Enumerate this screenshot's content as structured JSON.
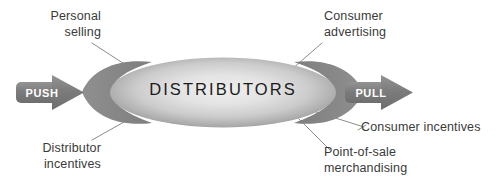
{
  "diagram": {
    "hub": {
      "label": "DISTRIBUTORS",
      "fill_center": "#e6e6e6",
      "fill_edge": "#8f8f8f"
    },
    "wings": {
      "fill": "#8a8a8a"
    },
    "arrows": [
      {
        "id": "push",
        "label": "PUSH",
        "direction": "right",
        "fill": "#7d7d7d",
        "text_color": "#ffffff"
      },
      {
        "id": "pull",
        "label": "PULL",
        "direction": "right",
        "fill": "#7d7d7d",
        "text_color": "#ffffff"
      }
    ],
    "callouts": [
      {
        "id": "personal-selling",
        "line1": "Personal",
        "line2": "selling",
        "align": "right",
        "position": "top-left"
      },
      {
        "id": "consumer-advertising",
        "line1": "Consumer",
        "line2": "advertising",
        "align": "left",
        "position": "top-right"
      },
      {
        "id": "distributor-incentives",
        "line1": "Distributor",
        "line2": "incentives",
        "align": "right",
        "position": "bottom-left"
      },
      {
        "id": "consumer-incentives",
        "line1": "Consumer incentives",
        "line2": "",
        "align": "left",
        "position": "right"
      },
      {
        "id": "point-of-sale-merchandising",
        "line1": "Point-of-sale",
        "line2": "merchandising",
        "align": "left",
        "position": "bottom-right"
      }
    ],
    "connector_color": "#8c8c8c",
    "text_color": "#3a3a3a",
    "background": "#ffffff"
  }
}
